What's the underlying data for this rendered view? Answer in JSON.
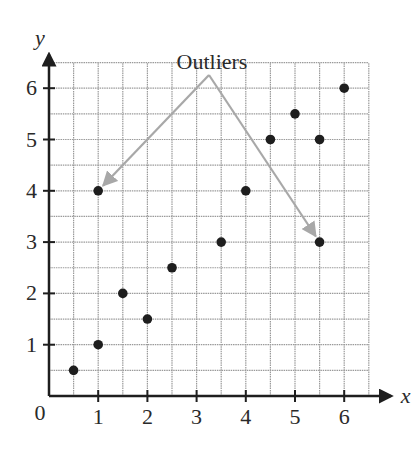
{
  "chart_data": {
    "type": "scatter",
    "title": "",
    "xlabel": "x",
    "ylabel": "y",
    "xlim": [
      0,
      6.5
    ],
    "ylim": [
      0,
      6.5
    ],
    "grid": true,
    "grid_step": 0.5,
    "x_ticks": [
      "1",
      "2",
      "3",
      "4",
      "5",
      "6"
    ],
    "y_ticks": [
      "1",
      "2",
      "3",
      "4",
      "5",
      "6"
    ],
    "origin_label": "0",
    "series": [
      {
        "name": "points",
        "points": [
          {
            "x": 0.5,
            "y": 0.5
          },
          {
            "x": 1,
            "y": 1
          },
          {
            "x": 1,
            "y": 4
          },
          {
            "x": 1.5,
            "y": 2
          },
          {
            "x": 2,
            "y": 1.5
          },
          {
            "x": 2.5,
            "y": 2.5
          },
          {
            "x": 3.5,
            "y": 3
          },
          {
            "x": 4,
            "y": 4
          },
          {
            "x": 4.5,
            "y": 5
          },
          {
            "x": 5,
            "y": 5.5
          },
          {
            "x": 5.5,
            "y": 5
          },
          {
            "x": 5.5,
            "y": 3
          },
          {
            "x": 6,
            "y": 6
          }
        ]
      }
    ],
    "annotations": [
      {
        "text": "Outliers",
        "arrows_to": [
          {
            "x": 1,
            "y": 4
          },
          {
            "x": 5.5,
            "y": 3
          }
        ]
      }
    ],
    "colors": {
      "point": "#1e1e1e",
      "grid": "#9a9a9a",
      "arrow": "#a8a8a8",
      "axis": "#1e1e1e"
    }
  }
}
